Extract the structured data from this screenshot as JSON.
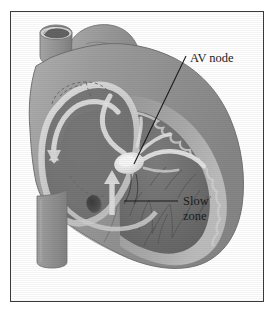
{
  "figure": {
    "type": "medical-illustration",
    "rendering": "grayscale airbrush-style anatomical drawing",
    "frame": {
      "border_color": "#3b3b3b",
      "background_color": "#ffffff"
    },
    "palette": {
      "background": "#ffffff",
      "myocardium_outer": "#9a9a9a",
      "myocardium_mid": "#8a8a8a",
      "chamber_dark": "#6f6f6f",
      "chamber_darker": "#606060",
      "wall_highlight": "#d3d3d3",
      "wall_light": "#c8c8c8",
      "conduction_bright": "#efefef",
      "vessel_gray": "#949494",
      "vessel_lumen": "#5a5a5a",
      "outline": "#4a4a4a",
      "label_text": "#1b1b1b",
      "leader_line": "#1b1b1b"
    }
  },
  "labels": [
    {
      "id": "av-node",
      "text": "AV node",
      "lines": [
        "AV node"
      ],
      "text_x": 190,
      "text_y": 62,
      "leader": {
        "from_x": 186,
        "from_y": 56,
        "to_x": 134,
        "to_y": 164
      }
    },
    {
      "id": "slow-zone",
      "text": "Slow zone",
      "lines": [
        "Slow",
        "zone"
      ],
      "text_x": 183,
      "text_y": 205,
      "line_height": 15,
      "leader": {
        "from_x": 178,
        "from_y": 201,
        "to_x": 124,
        "to_y": 201
      }
    }
  ],
  "anatomy": [
    {
      "id": "superior-vena-cava",
      "name": "Superior vena cava (cut)"
    },
    {
      "id": "pulmonary-artery",
      "name": "Pulmonary artery"
    },
    {
      "id": "right-atrium",
      "name": "Right atrium chamber"
    },
    {
      "id": "right-ventricle",
      "name": "Right ventricle with trabeculae"
    },
    {
      "id": "inferior-vena-cava",
      "name": "Inferior vena cava (descending vessel)"
    },
    {
      "id": "av-node-body",
      "name": "AV node (bright nodal tissue)"
    },
    {
      "id": "conduction-pathway",
      "name": "Conduction pathway / bundle branches"
    },
    {
      "id": "reentry-circuit-arrow",
      "name": "Reentry circuit arrow loop"
    },
    {
      "id": "slow-zone-spot",
      "name": "Slow zone dark focus"
    },
    {
      "id": "hidden-structure-dashes",
      "name": "Dashed hidden outline"
    }
  ]
}
